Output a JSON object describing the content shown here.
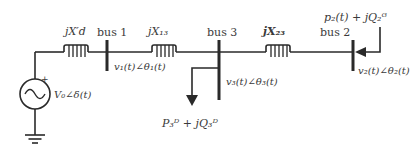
{
  "diagram": {
    "type": "power-system-one-line",
    "colors": {
      "line": "#2a2a2a",
      "text": "#3a3a3a",
      "background": "#ffffff"
    },
    "source": {
      "label": "V₀∠δ(t)",
      "polarity": "+"
    },
    "impedances": [
      {
        "id": "xd",
        "label": "jX′d"
      },
      {
        "id": "x13",
        "label": "jX₁₃"
      },
      {
        "id": "x23",
        "label": "jX₂₃"
      }
    ],
    "buses": [
      {
        "id": "bus1",
        "label": "bus 1",
        "voltage": "v₁(t)∠θ₁(t)"
      },
      {
        "id": "bus3",
        "label": "bus 3",
        "voltage": "v₃(t)∠θ₃(t)"
      },
      {
        "id": "bus2",
        "label": "bus 2",
        "voltage": "v₂(t)∠θ₂(t)"
      }
    ],
    "load": {
      "label": "P₃ᴰ + jQ₃ᴰ"
    },
    "generation": {
      "label": "p₂(t) + jQ₂ᴳ"
    }
  }
}
